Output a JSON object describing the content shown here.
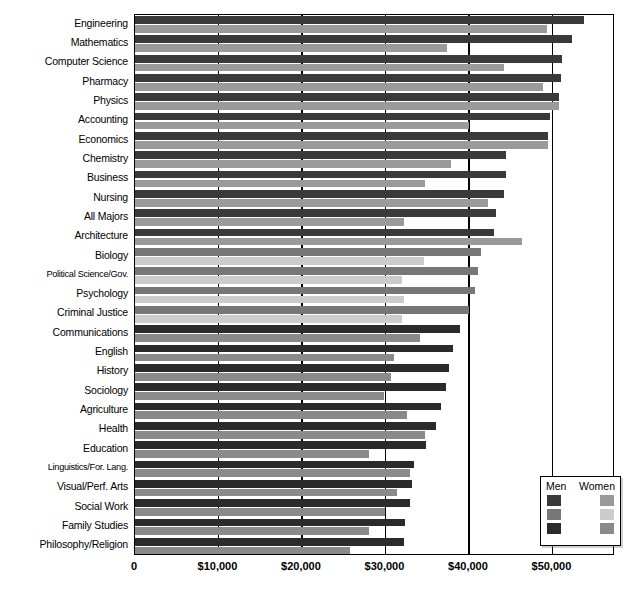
{
  "chart_data": {
    "type": "bar",
    "orientation": "horizontal",
    "title": "",
    "xlabel": "",
    "ylabel": "",
    "xlim": [
      0,
      57500
    ],
    "xticks": [
      0,
      10000,
      20000,
      30000,
      40000,
      50000
    ],
    "xticklabels": [
      "0",
      "$10,000",
      "$20,000",
      "$30,000",
      "$40,000",
      "$50,000"
    ],
    "grid": true,
    "legend": {
      "position": "bottom-right",
      "headers": [
        "Men",
        "Women"
      ],
      "swatches": [
        {
          "men": "#3a3a3a",
          "women": "#9a9a9a"
        },
        {
          "men": "#777777",
          "women": "#cccccc"
        },
        {
          "men": "#2b2b2b",
          "women": "#8a8a8a"
        }
      ]
    },
    "series": [
      {
        "name": "Men",
        "key": "men"
      },
      {
        "name": "Women",
        "key": "women"
      }
    ],
    "categories": [
      "Engineering",
      "Mathematics",
      "Computer Science",
      "Pharmacy",
      "Physics",
      "Accounting",
      "Economics",
      "Chemistry",
      "Business",
      "Nursing",
      "All Majors",
      "Architecture",
      "Biology",
      "Political Science/Gov.",
      "Psychology",
      "Criminal Justice",
      "Communications",
      "English",
      "History",
      "Sociology",
      "Agriculture",
      "Health",
      "Education",
      "Linguistics/For. Lang.",
      "Visual/Perf. Arts",
      "Social Work",
      "Family Studies",
      "Philosophy/Religion"
    ],
    "rows": [
      {
        "category": "Engineering",
        "men": 53800,
        "women": 49400,
        "group": 1
      },
      {
        "category": "Mathematics",
        "men": 52300,
        "women": 37400,
        "group": 1
      },
      {
        "category": "Computer Science",
        "men": 51100,
        "women": 44200,
        "group": 1
      },
      {
        "category": "Pharmacy",
        "men": 51000,
        "women": 48900,
        "group": 1
      },
      {
        "category": "Physics",
        "men": 50800,
        "women": 50800,
        "group": 1
      },
      {
        "category": "Accounting",
        "men": 49700,
        "women": 40000,
        "group": 1
      },
      {
        "category": "Economics",
        "men": 49500,
        "women": 49500,
        "group": 1
      },
      {
        "category": "Chemistry",
        "men": 44500,
        "women": 37800,
        "group": 1
      },
      {
        "category": "Business",
        "men": 44500,
        "women": 34700,
        "group": 1
      },
      {
        "category": "Nursing",
        "men": 44200,
        "women": 42300,
        "group": 1
      },
      {
        "category": "All Majors",
        "men": 43300,
        "women": 32200,
        "group": 1
      },
      {
        "category": "Architecture",
        "men": 43000,
        "women": 46300,
        "group": 1
      },
      {
        "category": "Biology",
        "men": 41400,
        "women": 34600,
        "group": 2
      },
      {
        "category": "Political Science/Gov.",
        "men": 41100,
        "women": 32000,
        "group": 2
      },
      {
        "category": "Psychology",
        "men": 40700,
        "women": 32200,
        "group": 2
      },
      {
        "category": "Criminal Justice",
        "men": 40000,
        "women": 32000,
        "group": 2
      },
      {
        "category": "Communications",
        "men": 38900,
        "women": 34200,
        "group": 3
      },
      {
        "category": "English",
        "men": 38100,
        "women": 31000,
        "group": 3
      },
      {
        "category": "History",
        "men": 37600,
        "women": 30700,
        "group": 3
      },
      {
        "category": "Sociology",
        "men": 37300,
        "women": 29800,
        "group": 3
      },
      {
        "category": "Agriculture",
        "men": 36600,
        "women": 32600,
        "group": 3
      },
      {
        "category": "Health",
        "men": 36000,
        "women": 34700,
        "group": 3
      },
      {
        "category": "Education",
        "men": 34800,
        "women": 28000,
        "group": 3
      },
      {
        "category": "Linguistics/For. Lang.",
        "men": 33400,
        "women": 32900,
        "group": 3
      },
      {
        "category": "Visual/Perf. Arts",
        "men": 33200,
        "women": 31400,
        "group": 3
      },
      {
        "category": "Social Work",
        "men": 33000,
        "women": 30000,
        "group": 3
      },
      {
        "category": "Family Studies",
        "men": 32400,
        "women": 28000,
        "group": 3
      },
      {
        "category": "Philosophy/Religion",
        "men": 32200,
        "women": 25800,
        "group": 3
      }
    ]
  },
  "colors": {
    "group1_men": "#3a3a3a",
    "group1_women": "#9a9a9a",
    "group2_men": "#777777",
    "group2_women": "#cccccc",
    "group3_men": "#2b2b2b",
    "group3_women": "#8a8a8a",
    "axis": "#000000",
    "background": "#ffffff"
  }
}
